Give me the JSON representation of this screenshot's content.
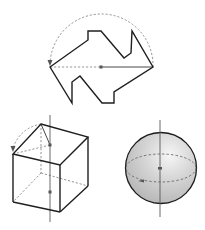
{
  "figures": {
    "polygon_rotation": {
      "label": "polygon rotated 180 degrees about center point",
      "outline_points": "50,67 88,40 88,31 101,31 124,58 131,53 132,31 153,67 114,92 114,103 102,103 80,76 72,82 72,103 50,67",
      "center": [
        101,
        67
      ],
      "left_tip": [
        50,
        67
      ],
      "right_tip": [
        153,
        67
      ],
      "arc_radius": 51.5,
      "colors": {
        "stroke": "#1f1f1f",
        "dashed": "#8a8a8a",
        "center_dot": "#555555"
      }
    },
    "cube_rotation": {
      "label": "cube rotated about vertical axis",
      "vertices": {
        "top_back_left": [
          41,
          124
        ],
        "top_back_right": [
          88,
          137
        ],
        "top_front_left": [
          13,
          154
        ],
        "top_front_right": [
          60,
          165
        ],
        "bottom_front_left": [
          13,
          202
        ],
        "bottom_front_right": [
          60,
          212
        ],
        "bottom_back_right": [
          88,
          186
        ],
        "bottom_back_left": [
          41,
          173
        ]
      },
      "axis": {
        "x": 50,
        "y1": 115,
        "y2": 222
      },
      "axis_points": [
        [
          50,
          145
        ],
        [
          50,
          192
        ]
      ]
    },
    "sphere_rotation": {
      "label": "sphere rotated about vertical axis",
      "center": [
        161,
        168
      ],
      "radius": 35.5,
      "equator": {
        "rx": 35,
        "ry": 14
      },
      "axis": {
        "x": 160,
        "y1": 120,
        "y2": 217
      },
      "colors": {
        "fill_light": "#f4f4f4",
        "fill_dark": "#b9b9b9",
        "outline": "#1a1a1a"
      }
    }
  }
}
